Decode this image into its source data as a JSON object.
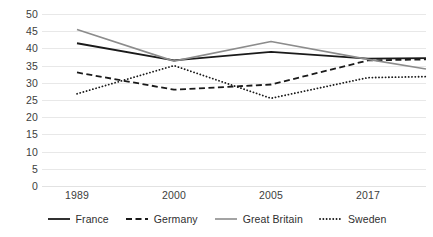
{
  "chart_data": {
    "type": "line",
    "title": "",
    "subtitle": "",
    "xlabel": "",
    "ylabel": "",
    "categories": [
      "1989",
      "2000",
      "2005",
      "2017"
    ],
    "x": [
      1989,
      2000,
      2005,
      2017
    ],
    "ylim": [
      0,
      50
    ],
    "yticks": [
      0,
      5,
      10,
      15,
      20,
      25,
      30,
      35,
      40,
      45,
      50
    ],
    "ytick_labels": [
      "0",
      "5",
      "10",
      "15",
      "20",
      "25",
      "30",
      "35",
      "40",
      "45",
      "50"
    ],
    "grid": true,
    "legend_position": "bottom",
    "series": [
      {
        "name": "France",
        "values": [
          41.5,
          36.5,
          39,
          37
        ],
        "style": "solid",
        "color": "#1a1a1a",
        "width": 1.8
      },
      {
        "name": "Germany",
        "values": [
          33,
          28,
          29.5,
          36.5
        ],
        "style": "dashed",
        "color": "#1a1a1a",
        "width": 1.8
      },
      {
        "name": "Great Britain",
        "values": [
          45.5,
          36.3,
          42,
          36.8
        ],
        "style": "solid",
        "color": "#8c8c8c",
        "width": 1.6
      },
      {
        "name": "Sweden",
        "values": [
          26.8,
          35,
          25.5,
          31.5
        ],
        "style": "dotted",
        "color": "#1a1a1a",
        "width": 1.8
      }
    ],
    "edge_extensions": {
      "note": "lines run slightly past the first and last category to the plot border",
      "left_values": [
        null,
        null,
        null,
        null
      ],
      "right_values": [
        37.2,
        36.8,
        34,
        31.8
      ]
    },
    "colors": {
      "gridline": "#e8e8e8",
      "tick_text": "#3d3d3d",
      "legend_text": "#2f2f2f",
      "background": "#ffffff"
    }
  },
  "legend": {
    "items": [
      {
        "label": "France",
        "icon": "solid-line-icon"
      },
      {
        "label": "Germany",
        "icon": "dashed-line-icon"
      },
      {
        "label": "Great Britain",
        "icon": "solid-line-gray-icon"
      },
      {
        "label": "Sweden",
        "icon": "dotted-line-icon"
      }
    ]
  }
}
